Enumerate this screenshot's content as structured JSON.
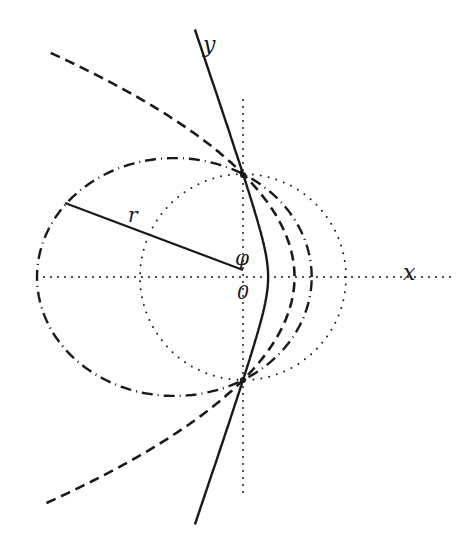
{
  "figure": {
    "width": 465,
    "height": 533,
    "background": "#ffffff",
    "ink_color": "#1a1a1a"
  },
  "labels": {
    "x_axis": "x",
    "y_axis": "y",
    "origin": "0",
    "angle": "φ",
    "radius": "r"
  },
  "geometry": {
    "origin_px": [
      243,
      277
    ],
    "semi_latus_rectum_px": 103,
    "x_axis_range_px": [
      37,
      452
    ],
    "y_axis_range_px": [
      100,
      494
    ],
    "radius_line": {
      "from": [
        65,
        203
      ],
      "to": [
        243,
        270
      ]
    },
    "latus_rectum_points": [
      [
        243,
        175
      ],
      [
        243,
        380
      ]
    ]
  },
  "curves": [
    {
      "name": "circle",
      "eccentricity": 0.0,
      "style": "dotted",
      "phi_range_deg": [
        0,
        360
      ]
    },
    {
      "name": "ellipse",
      "eccentricity": 0.5,
      "style": "dash-dot",
      "phi_range_deg": [
        0,
        360
      ]
    },
    {
      "name": "parabola",
      "eccentricity": 1.0,
      "style": "dashed",
      "phi_range_deg": [
        -131,
        131
      ]
    },
    {
      "name": "hyperbola",
      "eccentricity": 3.1,
      "style": "solid",
      "phi_range_deg": [
        -101,
        101
      ]
    }
  ],
  "chart_data": {
    "type": "diagram",
    "title": "",
    "series": [
      {
        "name": "circle",
        "e": 0.0,
        "line": "dotted"
      },
      {
        "name": "ellipse",
        "e": 0.5,
        "line": "dash-dot"
      },
      {
        "name": "parabola",
        "e": 1.0,
        "line": "dashed"
      },
      {
        "name": "hyperbola",
        "e": 3.1,
        "line": "solid"
      }
    ],
    "xlabel": "x",
    "ylabel": "y",
    "annotations": [
      "r",
      "φ",
      "0"
    ],
    "grid": false
  }
}
